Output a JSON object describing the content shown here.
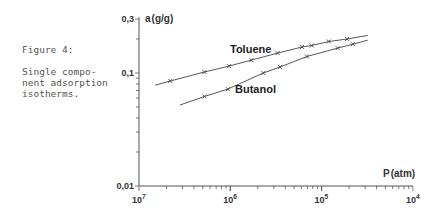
{
  "caption": {
    "title": "Figure 4:",
    "body": "Single compo-\nnent adsorption\nisotherms."
  },
  "chart_data": {
    "type": "line",
    "xlabel": "P (atm)",
    "ylabel": "a (g/g)",
    "xscale": "log",
    "yscale": "log",
    "xlim": [
      1e-07,
      0.0001
    ],
    "ylim": [
      0.01,
      0.3
    ],
    "x_tick_labels": [
      "10⁻⁷",
      "10⁻⁶",
      "10⁻⁵",
      "10⁻⁴"
    ],
    "x_tick_labels_as_printed": [
      "10",
      "10",
      "10",
      "10"
    ],
    "x_tick_exponents_as_printed": [
      "7",
      "6",
      "5",
      "4"
    ],
    "y_tick_labels": [
      "0,3",
      "0,1",
      "0,01"
    ],
    "grid": false,
    "legend": "inline labels",
    "series": [
      {
        "name": "Toluene",
        "points": [
          [
            2.2e-07,
            0.085
          ],
          [
            5.2e-07,
            0.102
          ],
          [
            9.7e-07,
            0.115
          ],
          [
            1.7e-06,
            0.13
          ],
          [
            3.3e-06,
            0.15
          ],
          [
            6.1e-06,
            0.17
          ],
          [
            7.8e-06,
            0.175
          ],
          [
            1.2e-05,
            0.19
          ],
          [
            1.9e-05,
            0.2
          ]
        ],
        "curve_range": [
          [
            1.5e-07,
            0.078
          ],
          [
            3.2e-05,
            0.215
          ]
        ]
      },
      {
        "name": "Butanol",
        "points": [
          [
            5.2e-07,
            0.062
          ],
          [
            9.4e-07,
            0.072
          ],
          [
            2.3e-06,
            0.1
          ],
          [
            3.5e-06,
            0.113
          ],
          [
            6.9e-06,
            0.14
          ],
          [
            1.5e-05,
            0.166
          ],
          [
            2.2e-05,
            0.18
          ]
        ],
        "curve_range": [
          [
            2.8e-07,
            0.052
          ],
          [
            3.2e-05,
            0.195
          ]
        ]
      }
    ]
  },
  "axes": {
    "y_title": "a",
    "y_unit": "(g/g)",
    "x_title": "P",
    "x_unit": "(atm)"
  },
  "series_labels": {
    "toluene": "Toluene",
    "butanol": "Butanol"
  },
  "colors": {
    "line": "#444444",
    "axis": "#555555",
    "caption": "#555555"
  }
}
